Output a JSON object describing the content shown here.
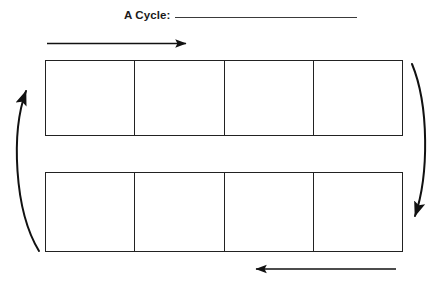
{
  "worksheet": {
    "title_label": "A Cycle:",
    "title_blank_value": "",
    "rows": [
      {
        "name": "top-row",
        "cells": [
          {
            "label": "",
            "value": ""
          },
          {
            "label": "",
            "value": ""
          },
          {
            "label": "",
            "value": ""
          },
          {
            "label": "",
            "value": ""
          }
        ]
      },
      {
        "name": "bottom-row",
        "cells": [
          {
            "label": "",
            "value": ""
          },
          {
            "label": "",
            "value": ""
          },
          {
            "label": "",
            "value": ""
          },
          {
            "label": "",
            "value": ""
          }
        ]
      }
    ],
    "arrows": [
      {
        "name": "top-arrow-right",
        "direction": "right"
      },
      {
        "name": "right-arrow-down",
        "direction": "down"
      },
      {
        "name": "bottom-arrow-left",
        "direction": "left"
      },
      {
        "name": "left-arrow-up",
        "direction": "up"
      }
    ],
    "colors": {
      "ink": "#222222",
      "rule": "#3a3a3a",
      "paper": "#ffffff"
    }
  }
}
